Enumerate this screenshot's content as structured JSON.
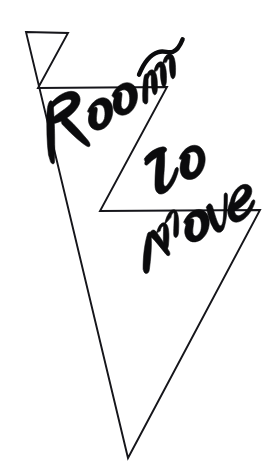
{
  "artwork": {
    "title": "Room To Move",
    "subject": "hand-drawn lightning bolt with brush-script lettering",
    "background_color": "#ffffff",
    "ink_color": "#15151a",
    "lettering_color": "#0b0b0d",
    "width": 278,
    "height": 475,
    "outline": {
      "name": "lightning-bolt-outline",
      "style": "thin single-weight ink contour, unfilled",
      "stroke_width": 1.9,
      "vertices": [
        [
          26,
          32
        ],
        [
          68,
          33
        ],
        [
          38,
          88
        ],
        [
          167,
          87
        ],
        [
          100,
          211
        ],
        [
          260,
          210
        ],
        [
          128,
          458
        ]
      ]
    },
    "words": [
      {
        "name": "word-room",
        "text": "Room",
        "position": [
          30,
          108
        ],
        "rotation_deg": -17,
        "style": "bold brush script with trailing flourish over the final m"
      },
      {
        "name": "word-to",
        "text": "To",
        "position": [
          138,
          150
        ],
        "rotation_deg": -14,
        "style": "bold brush script"
      },
      {
        "name": "word-move",
        "text": "Move",
        "position": [
          126,
          224
        ],
        "rotation_deg": -16,
        "style": "bold brush script"
      }
    ]
  }
}
